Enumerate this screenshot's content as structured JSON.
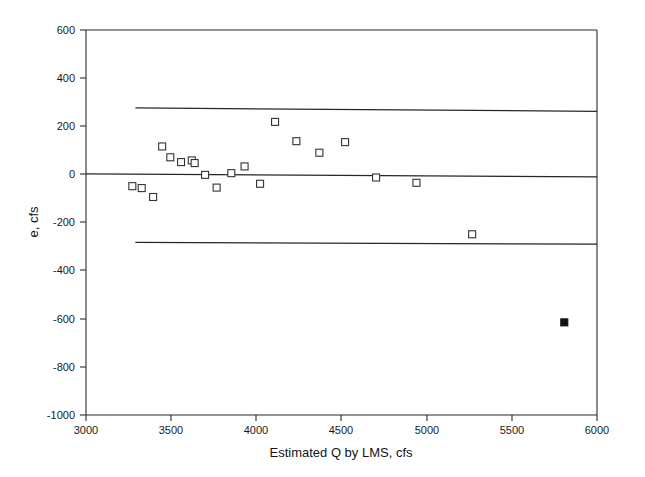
{
  "chart_data": {
    "type": "scatter",
    "title": "",
    "xlabel": "Estimated Q by LMS, cfs",
    "ylabel": "e, cfs",
    "xlim": [
      3000,
      6000
    ],
    "ylim": [
      -1000,
      600
    ],
    "xticks": [
      3000,
      3500,
      4000,
      4500,
      5000,
      5500,
      6000
    ],
    "yticks": [
      600,
      400,
      200,
      0,
      -200,
      -400,
      -600,
      -800,
      -1000
    ],
    "xtick_labels": [
      "3000",
      "3500",
      "4000",
      "4500",
      "5000",
      "5500",
      "6000"
    ],
    "ytick_labels": [
      "600",
      "400",
      "200",
      "0",
      "-200",
      "-400",
      "-600",
      "-800",
      "-1000"
    ],
    "grid": false,
    "legend": "none",
    "series": [
      {
        "name": "residuals",
        "marker": "open-square",
        "points": [
          {
            "x": 3272,
            "y": -49
          },
          {
            "x": 3327,
            "y": -57
          },
          {
            "x": 3394,
            "y": -94
          },
          {
            "x": 3447,
            "y": 116
          },
          {
            "x": 3495,
            "y": 71
          },
          {
            "x": 3558,
            "y": 51
          },
          {
            "x": 3621,
            "y": 58
          },
          {
            "x": 3638,
            "y": 47
          },
          {
            "x": 3699,
            "y": -2
          },
          {
            "x": 3767,
            "y": -55
          },
          {
            "x": 3853,
            "y": 5
          },
          {
            "x": 3931,
            "y": 33
          },
          {
            "x": 4022,
            "y": -39
          },
          {
            "x": 4110,
            "y": 218
          },
          {
            "x": 4235,
            "y": 138
          },
          {
            "x": 4370,
            "y": 90
          },
          {
            "x": 4521,
            "y": 134
          },
          {
            "x": 4703,
            "y": -13
          },
          {
            "x": 4940,
            "y": -35
          },
          {
            "x": 5267,
            "y": -249
          }
        ]
      },
      {
        "name": "outlier",
        "marker": "filled-square",
        "points": [
          {
            "x": 5808,
            "y": -615
          }
        ]
      }
    ],
    "reference_lines": [
      {
        "name": "upper-limit",
        "y_left": 276,
        "y_right": 262,
        "x_start": 3290,
        "x_end": 6000
      },
      {
        "name": "center-line",
        "y_left": 2,
        "y_right": -10,
        "x_start": 3000,
        "x_end": 6000
      },
      {
        "name": "lower-limit",
        "y_left": -283,
        "y_right": -290,
        "x_start": 3290,
        "x_end": 6000
      }
    ]
  },
  "axes": {
    "x_title": "Estimated Q by LMS, cfs",
    "y_title": "e, cfs"
  }
}
